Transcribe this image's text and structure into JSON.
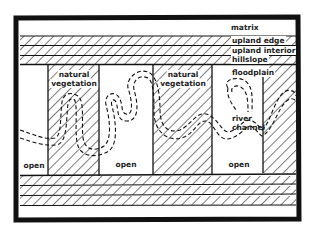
{
  "diagram": {
    "type": "landscape-ecology schematic (river corridor)",
    "colors": {
      "ink": "#111111",
      "background": "#ffffff"
    },
    "bands_top": [
      {
        "id": "matrix",
        "label": "matrix",
        "fill": "blank"
      },
      {
        "id": "upland-edge",
        "label": "upland edge",
        "fill": "hatched"
      },
      {
        "id": "upland-interior",
        "label": "upland interior",
        "fill": "hatched"
      },
      {
        "id": "hillslope",
        "label": "hillslope",
        "fill": "hatched"
      }
    ],
    "floodplain": {
      "label": "floodplain",
      "patches": [
        {
          "id": "open-1",
          "label": "open",
          "fill": "blank"
        },
        {
          "id": "natural-veg-1",
          "label": "natural vegetation",
          "line1": "natural",
          "line2": "vegetation",
          "fill": "hatched"
        },
        {
          "id": "open-2",
          "label": "open",
          "fill": "blank"
        },
        {
          "id": "natural-veg-2",
          "label": "natural vegetation",
          "line1": "natural",
          "line2": "vegetation",
          "fill": "hatched"
        },
        {
          "id": "open-3",
          "label": "open",
          "fill": "blank"
        },
        {
          "id": "natural-veg-3",
          "label": "",
          "fill": "hatched"
        }
      ]
    },
    "river": {
      "label": "river channel",
      "line1": "river",
      "line2": "channel",
      "style": "dashed double line, meandering, with oxbow loop"
    },
    "bands_bottom": [
      {
        "id": "hillslope-bottom",
        "fill": "hatched"
      },
      {
        "id": "upland-interior-bottom",
        "fill": "hatched"
      },
      {
        "id": "upland-edge-bottom",
        "fill": "hatched"
      },
      {
        "id": "matrix-bottom",
        "fill": "blank"
      }
    ]
  }
}
